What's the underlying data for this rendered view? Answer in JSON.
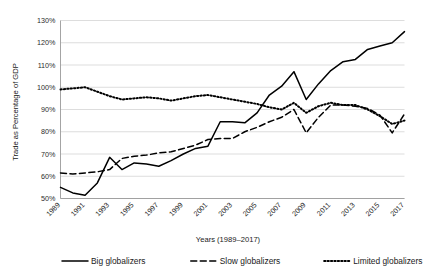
{
  "chart_data": {
    "type": "line",
    "title": "",
    "xlabel": "Years (1989–2017)",
    "ylabel": "Trade as Percentage of GDP",
    "grid": true,
    "legend_position": "bottom",
    "ylim": [
      50,
      130
    ],
    "ytick_labels": [
      "50%",
      "60%",
      "70%",
      "80%",
      "90%",
      "100%",
      "110%",
      "120%",
      "130%"
    ],
    "ytick_values": [
      50,
      60,
      70,
      80,
      90,
      100,
      110,
      120,
      130
    ],
    "x": [
      1989,
      1990,
      1991,
      1992,
      1993,
      1994,
      1995,
      1996,
      1997,
      1998,
      1999,
      2000,
      2001,
      2002,
      2003,
      2004,
      2005,
      2006,
      2007,
      2008,
      2009,
      2010,
      2011,
      2012,
      2013,
      2014,
      2015,
      2016,
      2017
    ],
    "xtick_labels": [
      "1989",
      "1991",
      "1993",
      "1995",
      "1997",
      "1999",
      "2001",
      "2003",
      "2005",
      "2007",
      "2009",
      "2011",
      "2013",
      "2015",
      "2017"
    ],
    "xtick_values": [
      1989,
      1991,
      1993,
      1995,
      1997,
      1999,
      2001,
      2003,
      2005,
      2007,
      2009,
      2011,
      2013,
      2015,
      2017
    ],
    "series": [
      {
        "name": "Big globalizers",
        "style": "solid",
        "values": [
          55.0,
          52.5,
          51.5,
          57.0,
          68.5,
          63.0,
          66.0,
          65.5,
          64.5,
          67.0,
          70.0,
          72.5,
          73.5,
          84.5,
          84.5,
          84.0,
          88.5,
          96.5,
          100.5,
          107.0,
          94.5,
          101.5,
          107.5,
          111.5,
          112.5,
          117.0,
          118.5,
          120.0,
          125.0
        ]
      },
      {
        "name": "Slow globalizers",
        "style": "dashed",
        "values": [
          61.5,
          61.0,
          61.5,
          62.0,
          63.0,
          68.0,
          69.0,
          69.5,
          70.5,
          71.0,
          72.5,
          74.0,
          76.5,
          77.0,
          77.0,
          80.0,
          82.0,
          84.5,
          86.5,
          90.0,
          79.5,
          86.5,
          92.0,
          92.0,
          91.5,
          90.5,
          87.5,
          79.5,
          88.0
        ]
      },
      {
        "name": "Limited globalizers",
        "style": "dotted",
        "values": [
          99.0,
          99.5,
          100.0,
          98.0,
          96.0,
          94.5,
          95.0,
          95.5,
          95.0,
          94.0,
          95.0,
          96.0,
          96.5,
          95.5,
          94.5,
          93.5,
          92.5,
          91.0,
          90.0,
          93.0,
          88.5,
          91.5,
          93.0,
          92.0,
          92.0,
          90.0,
          87.0,
          83.5,
          85.0
        ]
      }
    ]
  },
  "legend": {
    "items": [
      {
        "label": "Big globalizers"
      },
      {
        "label": "Slow globalizers"
      },
      {
        "label": "Limited globalizers"
      }
    ]
  }
}
